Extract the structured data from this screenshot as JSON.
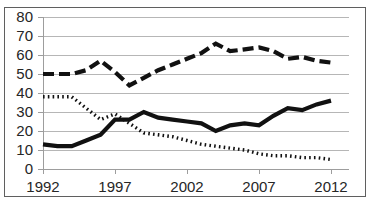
{
  "title_sliver": "",
  "axes": {
    "y_ticks": [
      "80",
      "70",
      "60",
      "50",
      "40",
      "30",
      "20",
      "10",
      "0"
    ],
    "x_ticks": [
      "1992",
      "1997",
      "2002",
      "2007",
      "2012"
    ],
    "y_label": "",
    "x_label": ""
  },
  "chart_data": {
    "type": "line",
    "title": "",
    "subtitle": "",
    "xlabel": "",
    "ylabel": "",
    "xlim": [
      1992,
      2012
    ],
    "ylim": [
      0,
      80
    ],
    "y_tick_values": [
      0,
      10,
      20,
      30,
      40,
      50,
      60,
      70,
      80
    ],
    "x_tick_values": [
      1992,
      1997,
      2002,
      2007,
      2012
    ],
    "grid": "horizontal",
    "legend": "none",
    "x": [
      1992,
      1993,
      1994,
      1995,
      1996,
      1997,
      1998,
      1999,
      2000,
      2001,
      2002,
      2003,
      2004,
      2005,
      2006,
      2007,
      2008,
      2009,
      2010,
      2011,
      2012
    ],
    "series": [
      {
        "name": "dashed-series",
        "style": "dashed",
        "color": "#111111",
        "values": [
          50,
          50,
          50,
          52,
          57,
          51,
          44,
          48,
          52,
          55,
          58,
          61,
          66,
          62,
          63,
          64,
          62,
          58,
          59,
          57,
          56
        ]
      },
      {
        "name": "solid-series",
        "style": "solid",
        "color": "#111111",
        "values": [
          13,
          12,
          12,
          15,
          18,
          26,
          26,
          30,
          27,
          26,
          25,
          24,
          20,
          23,
          24,
          23,
          28,
          32,
          31,
          34,
          36
        ]
      },
      {
        "name": "dotted-series",
        "style": "dotted",
        "color": "#111111",
        "values": [
          38,
          38,
          38,
          32,
          26,
          29,
          24,
          19,
          18,
          17,
          15,
          13,
          12,
          11,
          10,
          8,
          7,
          7,
          6,
          6,
          5
        ]
      }
    ]
  }
}
